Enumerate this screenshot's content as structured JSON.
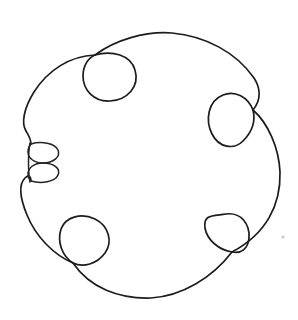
{
  "figure": {
    "background_color": "#ffffff",
    "stroke_color": "#1c1c1e",
    "stroke_width": "1.7",
    "canvas": {
      "width": 298,
      "height": 320
    },
    "bounds": {
      "left": 18,
      "top": 31,
      "right": 281,
      "bottom": 299
    },
    "components": [
      {
        "name": "main-circle",
        "kind": "closed-curve",
        "center_x": 149,
        "center_y": 165,
        "radius_x": 131,
        "radius_y": 134
      },
      {
        "name": "lobe-top-left",
        "kind": "teardrop-loop",
        "center_x": 107,
        "center_y": 74,
        "width": 56,
        "height": 48,
        "crossing_x": 95,
        "crossing_y": 55
      },
      {
        "name": "lobe-right",
        "kind": "teardrop-loop",
        "center_x": 234,
        "center_y": 121,
        "width": 52,
        "height": 52,
        "crossing_x": 253,
        "crossing_y": 110
      },
      {
        "name": "lobe-bottom-right",
        "kind": "teardrop-loop",
        "center_x": 224,
        "center_y": 241,
        "width": 52,
        "height": 50,
        "crossing_x": 232,
        "crossing_y": 252
      },
      {
        "name": "lobe-bottom-left",
        "kind": "teardrop-loop",
        "center_x": 85,
        "center_y": 245,
        "width": 54,
        "height": 52,
        "crossing_x": 73,
        "crossing_y": 263
      },
      {
        "name": "figure-eight-upper-loop",
        "kind": "small-ellipse",
        "center_x": 43,
        "center_y": 153,
        "width": 32,
        "height": 18
      },
      {
        "name": "figure-eight-lower-loop",
        "kind": "small-ellipse",
        "center_x": 43,
        "center_y": 172,
        "width": 32,
        "height": 18
      }
    ],
    "lobe_count": 4,
    "small_loop_count": 2,
    "crossing_count": 6
  },
  "artifacts": [
    {
      "name": "scan-speck",
      "x": 283,
      "y": 237
    }
  ]
}
